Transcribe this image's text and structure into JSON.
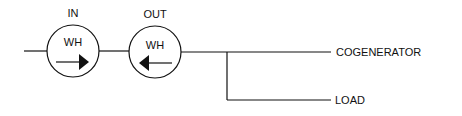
{
  "diagram": {
    "meters": [
      {
        "label": "IN",
        "inner_label": "WH",
        "arrow_direction": "right"
      },
      {
        "label": "OUT",
        "inner_label": "WH",
        "arrow_direction": "left"
      }
    ],
    "outputs": [
      {
        "label": "COGENERATOR"
      },
      {
        "label": "LOAD"
      }
    ],
    "colors": {
      "stroke": "#111111",
      "background": "#ffffff"
    }
  }
}
